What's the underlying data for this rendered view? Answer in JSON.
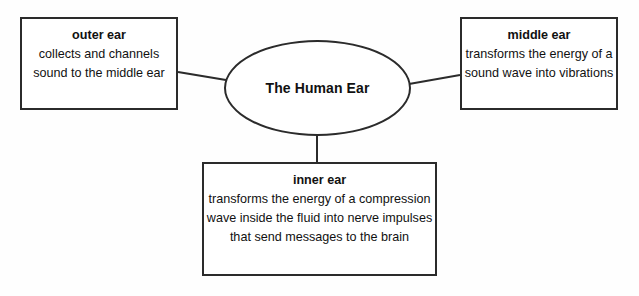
{
  "diagram": {
    "type": "concept-map",
    "background_color": "#fefefe",
    "line_color": "#2b2b2b",
    "text_color": "#111111",
    "center": {
      "label": "The Human Ear",
      "shape": "ellipse"
    },
    "nodes": [
      {
        "id": "outer-ear",
        "title": "outer ear",
        "description": "collects and channels sound to the middle ear",
        "position": "top-left"
      },
      {
        "id": "middle-ear",
        "title": "middle ear",
        "description": "transforms the energy of a sound wave into vibrations",
        "position": "top-right"
      },
      {
        "id": "inner-ear",
        "title": "inner ear",
        "description": "transforms the energy of a compression wave inside the fluid into nerve impulses that send messages to the brain",
        "position": "bottom-center"
      }
    ],
    "connectors": [
      {
        "id": "center-to-outer-ear",
        "from": "center",
        "to": "outer-ear"
      },
      {
        "id": "center-to-middle-ear",
        "from": "center",
        "to": "middle-ear"
      },
      {
        "id": "center-to-inner-ear",
        "from": "center",
        "to": "inner-ear"
      }
    ]
  }
}
